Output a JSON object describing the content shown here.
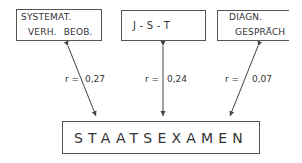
{
  "diagram": {
    "predictors": [
      {
        "id": "systemat",
        "line1": "SYSTEMAT.",
        "line2": "VERH.  BEOB."
      },
      {
        "id": "jst",
        "line1": "J - S - T"
      },
      {
        "id": "diagn",
        "line1": "DIAGN.",
        "line2": "GESPRÄCH"
      }
    ],
    "criterion": {
      "label": "STAATSEXAMEN"
    },
    "correlations": [
      {
        "from": "systemat",
        "to": "criterion",
        "prefix": "r =",
        "value": "0,27"
      },
      {
        "from": "jst",
        "to": "criterion",
        "prefix": "r =",
        "value": "0,24"
      },
      {
        "from": "diagn",
        "to": "criterion",
        "prefix": "r =",
        "value": "0,07"
      }
    ],
    "colors": {
      "line": "#444444",
      "text": "#333333",
      "background": "#ffffff"
    }
  }
}
